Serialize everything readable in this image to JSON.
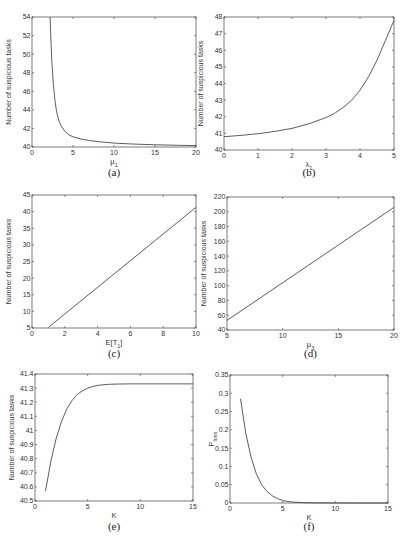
{
  "chart_data": [
    {
      "id": "a",
      "type": "line",
      "caption": "(a)",
      "title": "",
      "xlabel": "μ1",
      "ylabel": "Number of suspicious tasks",
      "xlim": [
        0,
        20
      ],
      "ylim": [
        40,
        54
      ],
      "xticks": [
        0,
        5,
        10,
        15,
        20
      ],
      "yticks": [
        40,
        42,
        44,
        46,
        48,
        50,
        52,
        54
      ],
      "grid": false,
      "x": [
        2.2,
        2.4,
        2.6,
        2.8,
        3.0,
        3.3,
        3.6,
        4.0,
        4.5,
        5.0,
        6.0,
        7.0,
        8.0,
        10.0,
        12.0,
        15.0,
        18.0,
        20.0
      ],
      "y": [
        54.0,
        49.5,
        46.8,
        45.0,
        43.8,
        42.8,
        42.2,
        41.7,
        41.3,
        41.1,
        40.85,
        40.7,
        40.58,
        40.42,
        40.33,
        40.24,
        40.18,
        40.15
      ]
    },
    {
      "id": "b",
      "type": "line",
      "caption": "(b)",
      "title": "",
      "xlabel": "λ1",
      "ylabel": "Number of suspicious tasks",
      "xlim": [
        0,
        5
      ],
      "ylim": [
        40,
        48
      ],
      "xticks": [
        0,
        1,
        2,
        3,
        4,
        5
      ],
      "yticks": [
        40,
        41,
        42,
        43,
        44,
        45,
        46,
        47,
        48
      ],
      "grid": false,
      "x": [
        0,
        0.5,
        1.0,
        1.5,
        2.0,
        2.5,
        3.0,
        3.25,
        3.5,
        3.75,
        4.0,
        4.25,
        4.5,
        4.75,
        5.0
      ],
      "y": [
        40.8,
        40.88,
        40.98,
        41.12,
        41.3,
        41.58,
        41.95,
        42.2,
        42.55,
        42.98,
        43.6,
        44.4,
        45.4,
        46.6,
        47.8
      ]
    },
    {
      "id": "c",
      "type": "line",
      "caption": "(c)",
      "title": "",
      "xlabel": "E[T1]",
      "ylabel": "Number of suspicious tasks",
      "xlim": [
        0,
        10
      ],
      "ylim": [
        5,
        45
      ],
      "xticks": [
        0,
        2,
        4,
        6,
        8,
        10
      ],
      "yticks": [
        5,
        10,
        15,
        20,
        25,
        30,
        35,
        40,
        45
      ],
      "grid": false,
      "x": [
        1,
        10
      ],
      "y": [
        5.2,
        41.3
      ]
    },
    {
      "id": "d",
      "type": "line",
      "caption": "(d)",
      "title": "",
      "xlabel": "μ3",
      "ylabel": "Number of suspicious tasks",
      "xlim": [
        5,
        20
      ],
      "ylim": [
        40,
        220
      ],
      "xticks": [
        5,
        10,
        15,
        20
      ],
      "yticks": [
        40,
        60,
        80,
        100,
        120,
        140,
        160,
        180,
        200,
        220
      ],
      "grid": false,
      "x": [
        5,
        20
      ],
      "y": [
        53,
        206
      ]
    },
    {
      "id": "e",
      "type": "line",
      "caption": "(e)",
      "title": "",
      "xlabel": "K",
      "ylabel": "Number of suspicious tasks",
      "xlim": [
        0,
        15
      ],
      "ylim": [
        40.5,
        41.4
      ],
      "xticks": [
        0,
        5,
        10,
        15
      ],
      "yticks": [
        40.5,
        40.6,
        40.7,
        40.8,
        40.9,
        41,
        41.1,
        41.2,
        41.3,
        41.4
      ],
      "grid": false,
      "x": [
        1,
        1.5,
        2,
        2.5,
        3,
        3.5,
        4,
        4.5,
        5,
        5.5,
        6,
        7,
        8,
        9,
        10,
        12,
        15
      ],
      "y": [
        40.57,
        40.78,
        40.94,
        41.06,
        41.15,
        41.21,
        41.255,
        41.28,
        41.3,
        41.312,
        41.32,
        41.327,
        41.329,
        41.33,
        41.33,
        41.33,
        41.33
      ]
    },
    {
      "id": "f",
      "type": "line",
      "caption": "(f)",
      "title": "",
      "xlabel": "K",
      "ylabel": "P_loss",
      "xlim": [
        0,
        15
      ],
      "ylim": [
        0,
        0.35
      ],
      "xticks": [
        0,
        5,
        10,
        15
      ],
      "yticks": [
        0,
        0.05,
        0.1,
        0.15,
        0.2,
        0.25,
        0.3,
        0.35
      ],
      "grid": false,
      "x": [
        1,
        1.5,
        2,
        2.5,
        3,
        3.5,
        4,
        4.5,
        5,
        5.5,
        6,
        7,
        8,
        10,
        12,
        15
      ],
      "y": [
        0.285,
        0.19,
        0.125,
        0.08,
        0.05,
        0.032,
        0.02,
        0.012,
        0.007,
        0.004,
        0.0025,
        0.001,
        0.0004,
        0.0001,
        0.0,
        0.0
      ]
    }
  ],
  "layout": [
    {
      "id": "a",
      "x0": 32,
      "x1": 196,
      "y0": 17,
      "y1": 147,
      "captionY": 176
    },
    {
      "id": "b",
      "x0": 224,
      "x1": 394,
      "y0": 17,
      "y1": 150,
      "captionY": 176
    },
    {
      "id": "c",
      "x0": 32,
      "x1": 196,
      "y0": 195,
      "y1": 328,
      "captionY": 357
    },
    {
      "id": "d",
      "x0": 227,
      "x1": 394,
      "y0": 197,
      "y1": 330,
      "captionY": 357
    },
    {
      "id": "e",
      "x0": 35,
      "x1": 193,
      "y0": 374,
      "y1": 501,
      "captionY": 530
    },
    {
      "id": "f",
      "x0": 230,
      "x1": 388,
      "y0": 375,
      "y1": 503,
      "captionY": 530
    }
  ]
}
